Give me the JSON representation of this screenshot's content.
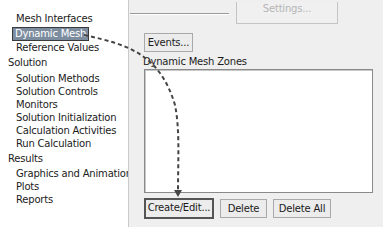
{
  "tree": {
    "items": [
      {
        "label": "Mesh Interfaces",
        "level": 1,
        "selected": false
      },
      {
        "label": "Dynamic Mesh",
        "level": 1,
        "selected": true
      },
      {
        "label": "Reference Values",
        "level": 1,
        "selected": false
      },
      {
        "label": "Solution",
        "level": 0,
        "selected": false
      },
      {
        "label": "Solution Methods",
        "level": 1,
        "selected": false
      },
      {
        "label": "Solution Controls",
        "level": 1,
        "selected": false
      },
      {
        "label": "Monitors",
        "level": 1,
        "selected": false
      },
      {
        "label": "Solution Initialization",
        "level": 1,
        "selected": false
      },
      {
        "label": "Calculation Activities",
        "level": 1,
        "selected": false
      },
      {
        "label": "Run Calculation",
        "level": 1,
        "selected": false
      },
      {
        "label": "Results",
        "level": 0,
        "selected": false
      },
      {
        "label": "Graphics and Animations",
        "level": 1,
        "selected": false
      },
      {
        "label": "Plots",
        "level": 1,
        "selected": false
      },
      {
        "label": "Reports",
        "level": 1,
        "selected": false
      }
    ]
  },
  "panel": {
    "settings_button": "Settings...",
    "events_button": "Events...",
    "zones_label": "Dynamic Mesh Zones",
    "zones_list": [],
    "buttons": {
      "create_edit": "Create/Edit...",
      "delete": "Delete",
      "delete_all": "Delete All"
    }
  },
  "annotation": {
    "type": "dashed-arrow",
    "from": "Dynamic Mesh",
    "to": "Create/Edit...",
    "color": "#444444"
  }
}
